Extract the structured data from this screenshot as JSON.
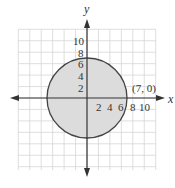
{
  "diagram": {
    "type": "circle-on-coordinate-plane",
    "circle": {
      "center": [
        0,
        0
      ],
      "radius": 7,
      "fill": "#dcdcdc",
      "stroke": "#444444"
    },
    "point_label": "(7, 0)",
    "axes": {
      "x_label": "x",
      "y_label": "y"
    },
    "x_ticks": [
      "2",
      "4",
      "6",
      "8",
      "10"
    ],
    "y_ticks": [
      "2",
      "4",
      "6",
      "8",
      "10"
    ],
    "grid": {
      "step": 2,
      "color": "#d4d4d4"
    }
  }
}
